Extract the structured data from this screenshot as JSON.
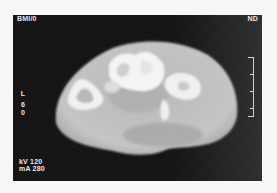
{
  "scan": {
    "header_left": "BMI/0",
    "header_right": "ND",
    "side_label": [
      "L",
      "6",
      "0"
    ],
    "kv_label": "kV 120",
    "ma_label": "mA 280"
  },
  "scale_bar": {
    "ticks": 5
  },
  "colors": {
    "background": "#141414",
    "tissue": "#c8c8c8",
    "bone": "#f2f2f2",
    "label": "#e8e8e8"
  }
}
